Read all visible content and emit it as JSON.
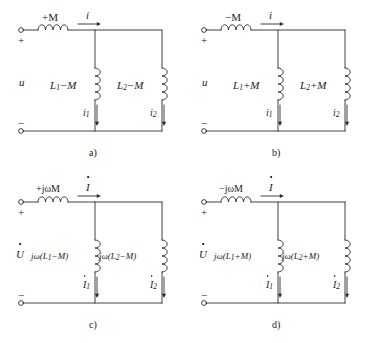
{
  "figure": {
    "stroke_color": "#2b2b2b",
    "background": "#ffffff"
  },
  "panels": [
    {
      "id": "a",
      "caption": "a)",
      "domain": "time",
      "source_label": "u",
      "source_has_dot": false,
      "plus_sign": "+",
      "minus_sign": "−",
      "series_label": "+M",
      "series_current": "i",
      "series_current_has_dot": false,
      "branch1_label_main": "L",
      "branch1_label_sub": "1",
      "branch1_label_tail": "−M",
      "branch2_label_main": "L",
      "branch2_label_sub": "2",
      "branch2_label_tail": "−M",
      "branch1_current_main": "i",
      "branch1_current_sub": "1",
      "branch2_current_main": "i",
      "branch2_current_sub": "2",
      "branch_current_has_dot": false
    },
    {
      "id": "b",
      "caption": "b)",
      "domain": "time",
      "source_label": "u",
      "source_has_dot": false,
      "plus_sign": "+",
      "minus_sign": "−",
      "series_label": "−M",
      "series_current": "i",
      "series_current_has_dot": false,
      "branch1_label_main": "L",
      "branch1_label_sub": "1",
      "branch1_label_tail": "+M",
      "branch2_label_main": "L",
      "branch2_label_sub": "2",
      "branch2_label_tail": "+M",
      "branch1_current_main": "i",
      "branch1_current_sub": "1",
      "branch2_current_main": "i",
      "branch2_current_sub": "2",
      "branch_current_has_dot": false
    },
    {
      "id": "c",
      "caption": "c)",
      "domain": "phasor",
      "source_label": "U",
      "source_has_dot": true,
      "plus_sign": "+",
      "minus_sign": "−",
      "series_label": "+jωM",
      "series_current": "I",
      "series_current_has_dot": true,
      "branch1_label_main": "jω(L",
      "branch1_label_sub": "1",
      "branch1_label_tail": "−M)",
      "branch2_label_main": "jω(L",
      "branch2_label_sub": "2",
      "branch2_label_tail": "−M)",
      "branch1_current_main": "I",
      "branch1_current_sub": "1",
      "branch2_current_main": "I",
      "branch2_current_sub": "2",
      "branch_current_has_dot": true
    },
    {
      "id": "d",
      "caption": "d)",
      "domain": "phasor",
      "source_label": "U",
      "source_has_dot": true,
      "plus_sign": "+",
      "minus_sign": "−",
      "series_label": "−jωM",
      "series_current": "I",
      "series_current_has_dot": true,
      "branch1_label_main": "jω(L",
      "branch1_label_sub": "1",
      "branch1_label_tail": "+M)",
      "branch2_label_main": "jω(L",
      "branch2_label_sub": "2",
      "branch2_label_tail": "+M)",
      "branch1_current_main": "I",
      "branch1_current_sub": "1",
      "branch2_current_main": "I",
      "branch2_current_sub": "2",
      "branch_current_has_dot": true
    }
  ]
}
